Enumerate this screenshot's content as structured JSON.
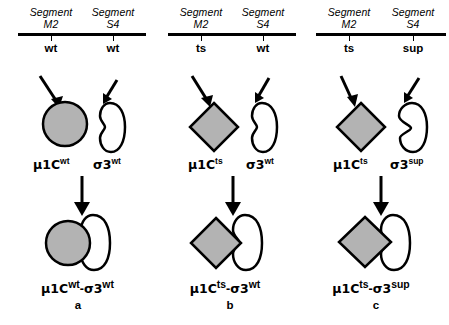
{
  "figure": {
    "background_color": "#ffffff",
    "stroke_color": "#000000",
    "protein_fill_gray": "#b3b3b3"
  },
  "panels": [
    {
      "letter": "a",
      "segments": [
        {
          "name_line1": "Segment",
          "name_line2": "M2",
          "allele": "wt"
        },
        {
          "name_line1": "Segment",
          "name_line2": "S4",
          "allele": "wt"
        }
      ],
      "proteins": [
        {
          "base": "μ1C",
          "sup": "wt",
          "shape": "circle",
          "fill": "#b3b3b3"
        },
        {
          "base": "σ3",
          "sup": "wt",
          "shape": "bean-smooth",
          "fill": "#ffffff"
        }
      ],
      "complex": {
        "base_left": "μ1C",
        "sup_left": "wt",
        "dash": "-",
        "base_right": "σ3",
        "sup_right": "wt"
      }
    },
    {
      "letter": "b",
      "segments": [
        {
          "name_line1": "Segment",
          "name_line2": "M2",
          "allele": "ts"
        },
        {
          "name_line1": "Segment",
          "name_line2": "S4",
          "allele": "wt"
        }
      ],
      "proteins": [
        {
          "base": "μ1C",
          "sup": "ts",
          "shape": "diamond",
          "fill": "#b3b3b3"
        },
        {
          "base": "σ3",
          "sup": "wt",
          "shape": "bean-smooth",
          "fill": "#ffffff"
        }
      ],
      "complex": {
        "base_left": "μ1C",
        "sup_left": "ts",
        "dash": "-",
        "base_right": "σ3",
        "sup_right": "wt"
      }
    },
    {
      "letter": "c",
      "segments": [
        {
          "name_line1": "Segment",
          "name_line2": "M2",
          "allele": "ts"
        },
        {
          "name_line1": "Segment",
          "name_line2": "S4",
          "allele": "sup"
        }
      ],
      "proteins": [
        {
          "base": "μ1C",
          "sup": "ts",
          "shape": "diamond",
          "fill": "#b3b3b3"
        },
        {
          "base": "σ3",
          "sup": "sup",
          "shape": "bean-angular",
          "fill": "#ffffff"
        }
      ],
      "complex": {
        "base_left": "μ1C",
        "sup_left": "ts",
        "dash": "-",
        "base_right": "σ3",
        "sup_right": "sup"
      }
    }
  ]
}
